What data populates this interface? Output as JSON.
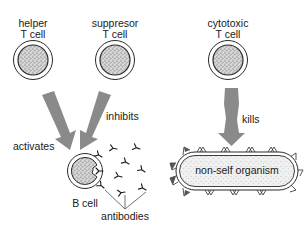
{
  "diagram": {
    "type": "immune-system-cell-interactions",
    "colors": {
      "arrow": "#8a8a8a",
      "cell_fill": "#c9c9c9",
      "outline": "#2a2a2a",
      "background": "#ffffff"
    },
    "cells": {
      "helper": {
        "line1": "helper",
        "line2": "T cell"
      },
      "suppressor": {
        "line1": "suppresor",
        "line2": "T cell"
      },
      "cytotoxic": {
        "line1": "cytotoxic",
        "line2": "T cell"
      },
      "b_cell": {
        "label": "B cell"
      }
    },
    "relations": {
      "activates": "activates",
      "inhibits": "inhibits",
      "kills": "kills"
    },
    "antibodies_label": "antibodies",
    "organism_label": "non-self organism"
  }
}
